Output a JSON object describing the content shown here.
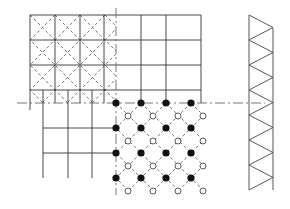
{
  "diagram": {
    "title": "",
    "colors": {
      "line": "#333333",
      "axis": "#666666",
      "filled_atom": "#111111",
      "open_atom": "#ffffff"
    },
    "grid": {
      "origin": [
        30,
        15
      ],
      "cell": 24.5,
      "cols_upper": 7,
      "rows_upper": 4
    },
    "axes": {
      "horizontal_y": 103,
      "vertical_x": 116
    },
    "lattice": {
      "filled_points": "x=116+25i, y=103+25j (i,j=0..3)",
      "open_points": "x=128+25i, y=116+25j (i,j=0..3)"
    },
    "truss": {
      "left_x": 249,
      "right_x": 273,
      "top_y": 15,
      "bottom_y": 190,
      "segments": 7
    }
  }
}
